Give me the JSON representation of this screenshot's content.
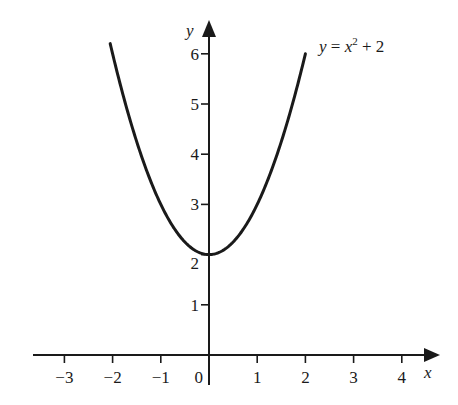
{
  "chart_data": {
    "type": "line",
    "title": "",
    "xlabel": "x",
    "ylabel": "y",
    "function": "y = x^2 + 2",
    "series": [
      {
        "name": "y = x² + 2",
        "x": [
          -2.05,
          -1.5,
          -1,
          -0.5,
          0,
          0.5,
          1,
          1.5,
          2
        ],
        "values": [
          6.2,
          4.25,
          3,
          2.25,
          2,
          2.25,
          3,
          4.25,
          6
        ]
      }
    ],
    "xticks": [
      "−3",
      "−2",
      "−1",
      "0",
      "1",
      "2",
      "3",
      "4"
    ],
    "xtick_values": [
      -3,
      -2,
      -1,
      0,
      1,
      2,
      3,
      4
    ],
    "yticks": [
      "1",
      "2",
      "3",
      "4",
      "5",
      "6"
    ],
    "ytick_values": [
      1,
      2,
      3,
      4,
      5,
      6
    ],
    "xlim": [
      -3.7,
      4.6
    ],
    "ylim": [
      0,
      6.9
    ],
    "grid": false,
    "legend": "none",
    "annotations": [
      {
        "text": "y = x² + 2",
        "x": 2.2,
        "y": 6.3
      }
    ]
  },
  "labels": {
    "x_axis": "x",
    "y_axis": "y",
    "curve_label_y": "y",
    "curve_label_eq": " = ",
    "curve_label_x": "x",
    "curve_label_exp": "2",
    "curve_label_rest": " + 2"
  }
}
